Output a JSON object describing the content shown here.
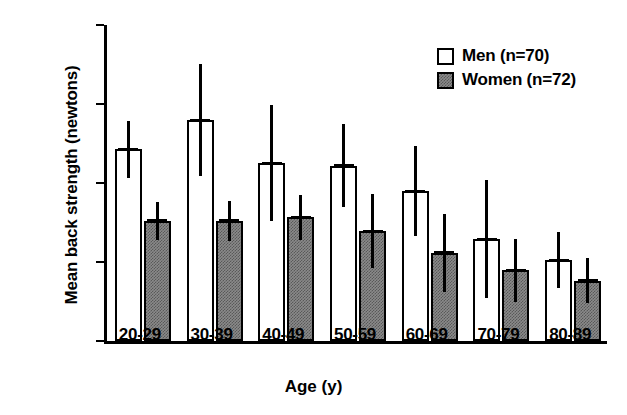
{
  "chart_data": {
    "type": "bar",
    "title": "",
    "xlabel": "Age (y)",
    "ylabel": "Mean back strength (newtons)",
    "categories": [
      "20-29",
      "30-39",
      "40-49",
      "50-59",
      "60-69",
      "70-79",
      "80-89"
    ],
    "ylim": [
      0,
      800
    ],
    "yticks": [
      0,
      200,
      400,
      600,
      800
    ],
    "ytick_labels": [
      "0",
      "200",
      "400",
      "600",
      "800"
    ],
    "grid": false,
    "legend_position": "top-right",
    "error_bars": "symmetric (SD)",
    "series": [
      {
        "name": "Men (n=70)",
        "fill": "#ffffff",
        "values": [
          485,
          559,
          450,
          444,
          379,
          258,
          205
        ],
        "errors": [
          73,
          142,
          147,
          105,
          114,
          150,
          72
        ],
        "err_low": [
          412,
          417,
          303,
          339,
          265,
          108,
          133
        ],
        "err_high": [
          558,
          701,
          597,
          549,
          493,
          408,
          277
        ]
      },
      {
        "name": "Women (n=72)",
        "fill": "#8a8a8a",
        "values": [
          304,
          304,
          313,
          278,
          223,
          179,
          153
        ],
        "errors": [
          49,
          50,
          57,
          93,
          99,
          80,
          56
        ],
        "err_low": [
          255,
          254,
          256,
          185,
          124,
          99,
          97
        ],
        "err_high": [
          353,
          354,
          370,
          371,
          322,
          259,
          209
        ]
      }
    ]
  },
  "legend": {
    "items": [
      {
        "label": "Men (n=70)",
        "swatch": "men"
      },
      {
        "label": "Women (n=72)",
        "swatch": "women"
      }
    ]
  },
  "axis": {
    "y_title": "Mean back strength (newtons)",
    "x_title": "Age (y)"
  }
}
